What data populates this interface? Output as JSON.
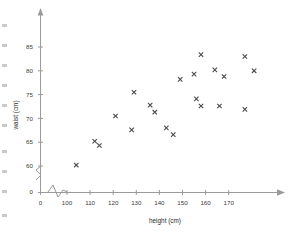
{
  "chart_data": {
    "type": "scatter",
    "title": "",
    "xlabel": "height (cm)",
    "ylabel": "waist (cm)",
    "xlim": [
      96,
      182
    ],
    "ylim": [
      57.5,
      88
    ],
    "grid": false,
    "legend": null,
    "marker": "x",
    "marker_color": "#4a4a4a",
    "axis_color": "#9a9a9a",
    "axis_break_x": true,
    "axis_break_y": true,
    "xticks": [
      0,
      100,
      110,
      120,
      130,
      140,
      150,
      160,
      170
    ],
    "xtick_labels": [
      "0",
      "100",
      "110",
      "120",
      "130",
      "140",
      "150",
      "160",
      "170"
    ],
    "yticks": [
      0,
      60,
      65,
      70,
      75,
      80,
      85
    ],
    "ytick_labels": [
      "0",
      "60",
      "65",
      "70",
      "75",
      "80",
      "85"
    ],
    "points": [
      {
        "x": 104,
        "y": 60.2
      },
      {
        "x": 112,
        "y": 65.2
      },
      {
        "x": 114,
        "y": 64.3
      },
      {
        "x": 121,
        "y": 70.5
      },
      {
        "x": 128,
        "y": 67.6
      },
      {
        "x": 129,
        "y": 75.5
      },
      {
        "x": 136,
        "y": 72.8
      },
      {
        "x": 138,
        "y": 71.3
      },
      {
        "x": 143,
        "y": 68.0
      },
      {
        "x": 146,
        "y": 66.6
      },
      {
        "x": 149,
        "y": 78.2
      },
      {
        "x": 155,
        "y": 79.3
      },
      {
        "x": 156,
        "y": 74.1
      },
      {
        "x": 158,
        "y": 83.4
      },
      {
        "x": 158,
        "y": 72.6
      },
      {
        "x": 164,
        "y": 80.2
      },
      {
        "x": 166,
        "y": 72.6
      },
      {
        "x": 168,
        "y": 78.8
      },
      {
        "x": 177,
        "y": 83.0
      },
      {
        "x": 177,
        "y": 71.9
      },
      {
        "x": 181,
        "y": 80.0
      }
    ]
  },
  "axes": {
    "x_title": "height (cm)",
    "y_title": "waist (cm)"
  }
}
